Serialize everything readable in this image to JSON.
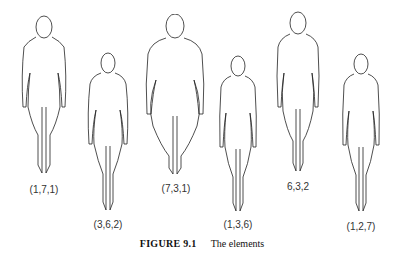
{
  "figures": [
    {
      "label": "(1,7,1)"
    },
    {
      "label": "(3,6,2)"
    },
    {
      "label": "(7,3,1)"
    },
    {
      "label": "(1,3,6)"
    },
    {
      "label": "6,3,2"
    },
    {
      "label": "(1,2,7)"
    }
  ],
  "caption": {
    "number": "FIGURE 9.1",
    "text": "The elements"
  }
}
